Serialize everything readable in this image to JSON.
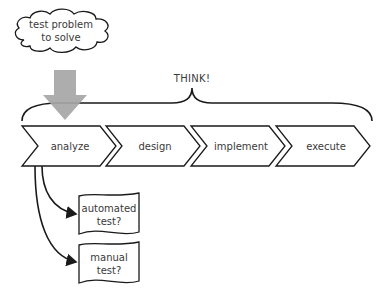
{
  "cloud": {
    "line1": "test problem",
    "line2": "to solve"
  },
  "brace": {
    "label": "THINK!"
  },
  "steps": [
    {
      "label": "analyze"
    },
    {
      "label": "design"
    },
    {
      "label": "implement"
    },
    {
      "label": "execute"
    }
  ],
  "outputs": [
    {
      "line1": "automated",
      "line2": "test?"
    },
    {
      "line1": "manual",
      "line2": "test?"
    }
  ],
  "colors": {
    "stroke": "#1a1a1a",
    "arrow_fill": "#a6a6a6",
    "text": "#3a3a3a"
  }
}
